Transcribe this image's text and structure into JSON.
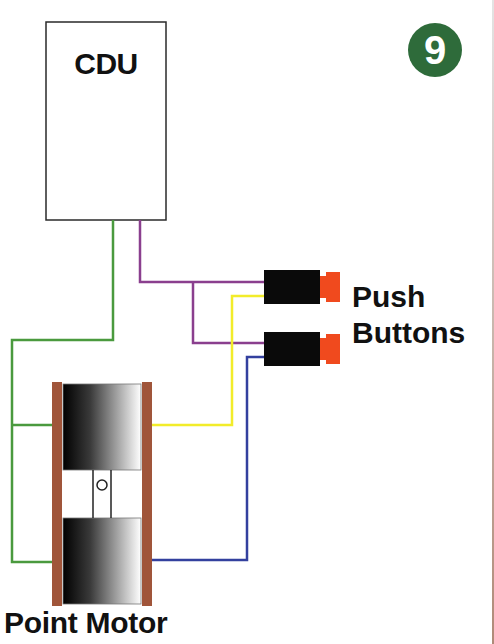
{
  "diagram": {
    "title_badge": {
      "text": "9",
      "color": "#2e6b3a"
    },
    "components": {
      "cdu": {
        "label": "CDU"
      },
      "push_buttons": {
        "label_line1": "Push",
        "label_line2": "Buttons",
        "count": 2,
        "body_color": "#0a0a0a",
        "cap_color": "#f04a1e"
      },
      "point_motor": {
        "label": "Point Motor",
        "frame_color": "#a0553a"
      }
    },
    "wires": [
      {
        "name": "green",
        "color": "#4a9a3e",
        "connects": "CDU common to both point motor coils"
      },
      {
        "name": "purple",
        "color": "#8a3f8e",
        "connects": "CDU to both push buttons"
      },
      {
        "name": "yellow",
        "color": "#f2ec2a",
        "connects": "Push button 1 to upper motor coil"
      },
      {
        "name": "blue",
        "color": "#33409e",
        "connects": "Push button 2 to lower motor coil"
      }
    ]
  }
}
